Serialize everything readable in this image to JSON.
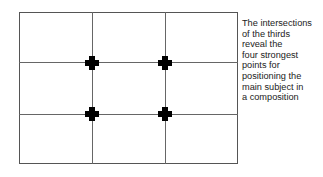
{
  "diagram": {
    "grid": {
      "columns": 3,
      "rows": 3
    },
    "intersections": [
      {
        "row": 1,
        "col": 1
      },
      {
        "row": 1,
        "col": 2
      },
      {
        "row": 2,
        "col": 1
      },
      {
        "row": 2,
        "col": 2
      }
    ],
    "marker_color": "#000000",
    "line_color": "#666666"
  },
  "caption": {
    "lines": [
      "The intersections",
      "of the thirds",
      "reveal the",
      "four strongest",
      "points for",
      "positioning the",
      "main subject in",
      "a composition"
    ]
  }
}
